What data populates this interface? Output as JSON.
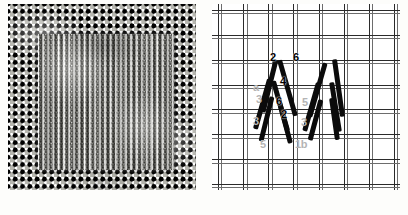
{
  "figure": {
    "kind": "needlework-plate",
    "caption": "",
    "panels": [
      {
        "id": "photo",
        "title": "worked sample photograph"
      },
      {
        "id": "diagram",
        "title": "stitch working diagram"
      }
    ]
  },
  "photo_panel": {
    "name": "embroidered-canvas-photograph",
    "canvas_description": "open even-weave canvas mesh",
    "worked_area_description": "square block of vertical slanted stitches",
    "colors": {
      "canvas_dark": "#111111",
      "canvas_light": "#f4f4f2",
      "stitch_grey": "#8b8b88"
    }
  },
  "diagram_panel": {
    "name": "stitch-working-diagram",
    "grid_description": "drawn canvas threads, 7 columns by 7 rows",
    "grid_columns": 7,
    "grid_rows": 7,
    "colors": {
      "stitch_stroke": "#0b0b0b",
      "grid_line": "#2b2b2b",
      "ghost_label": "#b4b4b4"
    },
    "labels": [
      {
        "text": "2",
        "style": "dark",
        "x": 58,
        "y": 48
      },
      {
        "text": "6",
        "style": "dark",
        "x": 81,
        "y": 48
      },
      {
        "text": "4",
        "style": "dark",
        "x": 68,
        "y": 72
      },
      {
        "text": "6",
        "style": "dark",
        "x": 64,
        "y": 92
      },
      {
        "text": "2",
        "style": "dark",
        "x": 69,
        "y": 105
      },
      {
        "text": "a",
        "style": "ghost",
        "x": 41,
        "y": 78
      },
      {
        "text": "3",
        "style": "ghost",
        "x": 44,
        "y": 90
      },
      {
        "text": "3",
        "style": "ghost",
        "x": 41,
        "y": 112
      },
      {
        "text": "5",
        "style": "ghost",
        "x": 90,
        "y": 93
      },
      {
        "text": "3",
        "style": "ghost",
        "x": 89,
        "y": 113
      },
      {
        "text": "5",
        "style": "ghost",
        "x": 48,
        "y": 135
      },
      {
        "text": "1b",
        "style": "ghost",
        "x": 83,
        "y": 135
      }
    ],
    "stitches": [
      {
        "left": 55,
        "top": 55,
        "len": 54,
        "angle": 14,
        "w": 5
      },
      {
        "left": 48,
        "top": 74,
        "len": 52,
        "angle": 16,
        "w": 5
      },
      {
        "left": 52,
        "top": 92,
        "len": 46,
        "angle": 14,
        "w": 5
      },
      {
        "left": 73,
        "top": 55,
        "len": 58,
        "angle": -16,
        "w": 5
      },
      {
        "left": 66,
        "top": 76,
        "len": 52,
        "angle": -16,
        "w": 5
      },
      {
        "left": 70,
        "top": 94,
        "len": 46,
        "angle": -15,
        "w": 5
      },
      {
        "left": 103,
        "top": 58,
        "len": 56,
        "angle": 16,
        "w": 5
      },
      {
        "left": 97,
        "top": 78,
        "len": 50,
        "angle": 16,
        "w": 5
      },
      {
        "left": 101,
        "top": 95,
        "len": 42,
        "angle": 15,
        "w": 5
      },
      {
        "left": 124,
        "top": 55,
        "len": 58,
        "angle": -8,
        "w": 5
      },
      {
        "left": 121,
        "top": 78,
        "len": 50,
        "angle": -9,
        "w": 5
      },
      {
        "left": 120,
        "top": 94,
        "len": 42,
        "angle": -8,
        "w": 5
      }
    ]
  }
}
